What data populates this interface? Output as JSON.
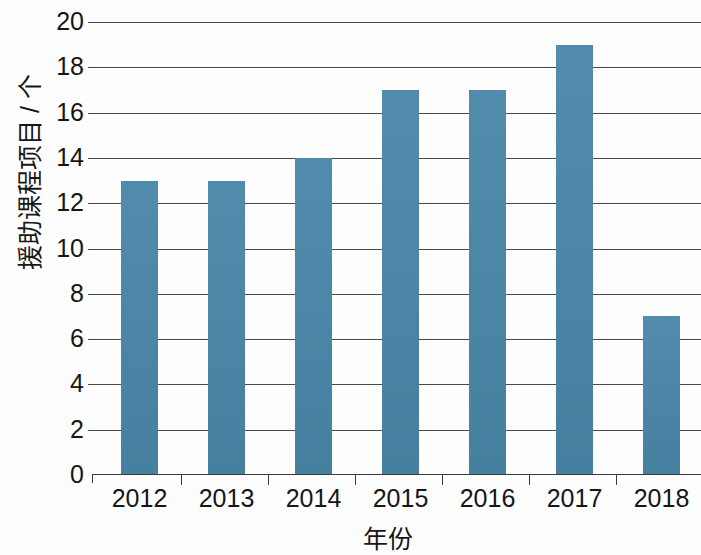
{
  "chart_data": {
    "type": "bar",
    "title": "",
    "subtitle": "",
    "categories": [
      "2012",
      "2013",
      "2014",
      "2015",
      "2016",
      "2017",
      "2018"
    ],
    "values": [
      13,
      13,
      14,
      17,
      17,
      19,
      7
    ],
    "series": [
      {
        "name": "援助课程项目",
        "values": [
          13,
          13,
          14,
          17,
          17,
          19,
          7
        ]
      }
    ],
    "xlabel": "年份",
    "ylabel": "援助课程项目 / 个",
    "ylim": [
      0,
      20
    ],
    "ytick_labels": [
      "20",
      "18",
      "16",
      "14",
      "12",
      "10",
      "8",
      "6",
      "4",
      "2",
      "0"
    ],
    "ytick_values": [
      20,
      18,
      16,
      14,
      12,
      10,
      8,
      6,
      4,
      2,
      0
    ],
    "ytick_step": 2,
    "grid": true,
    "grid_axis": "y",
    "legend": false,
    "legend_position": "none",
    "bar_color": "#4a87a8",
    "grid_color": "#3b3b3b",
    "axis_color": "#3b3b3b",
    "background_color": "#fefefe",
    "annotations": []
  }
}
